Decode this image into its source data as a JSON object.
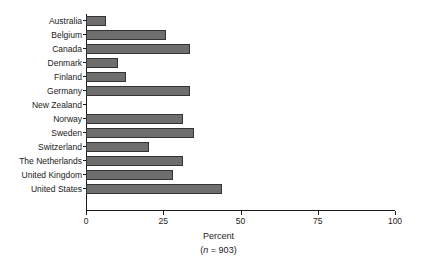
{
  "chart_data": {
    "type": "bar",
    "orientation": "horizontal",
    "title": "",
    "xlabel": "Percent",
    "xlabel_note": "(n = 903)",
    "ylabel": "",
    "xlim": [
      0,
      100
    ],
    "xticks": [
      0,
      25,
      50,
      75,
      100
    ],
    "xtick_labels": [
      "0",
      "25",
      "50",
      "75",
      "100"
    ],
    "grid": false,
    "legend": false,
    "bar_color": "#6e6e6e",
    "bar_edge_color": "#333333",
    "axis_color": "#1a1a1a",
    "categories": [
      "Australia",
      "Belgium",
      "Canada",
      "Denmark",
      "Finland",
      "Germany",
      "New Zealand",
      "Norway",
      "Sweden",
      "Switzerland",
      "The Netherlands",
      "United Kingdom",
      "United States"
    ],
    "values": [
      6.5,
      26,
      33.5,
      10.5,
      13,
      33.5,
      0,
      31.5,
      35,
      20.5,
      31.5,
      28,
      44
    ]
  }
}
